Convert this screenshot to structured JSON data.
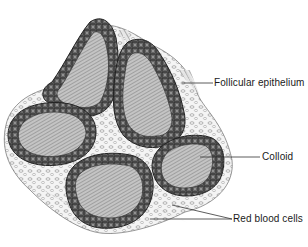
{
  "figure": {
    "top_caption_cropped": "",
    "labels": [
      {
        "id": "follicular-epithelium",
        "text": "Follicular epithelium"
      },
      {
        "id": "colloid",
        "text": "Colloid"
      },
      {
        "id": "red-blood-cells",
        "text": "Red blood cells"
      }
    ]
  },
  "colors": {
    "background": "#ffffff",
    "epithelium_fill": "#6e6e6e",
    "epithelium_outline": "#2a2a2a",
    "cell_nucleus": "#9a9a9a",
    "colloid_fill": "#bdbdbd",
    "colloid_hatch": "#7a7a7a",
    "stroma": "#f2f2f2",
    "leader_line": "#333333",
    "label_text": "#1a1a1a"
  }
}
